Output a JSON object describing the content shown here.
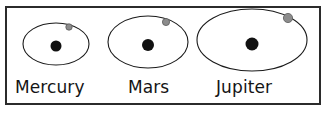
{
  "figure": {
    "background_color": "#ffffff",
    "frame": {
      "border_color": "#2b2b2b",
      "border_width": 2,
      "fill_color": "#ffffff"
    },
    "colors": {
      "orbit_stroke": "#1a1a1a",
      "central_body": "#111111",
      "orbiting_body_fill": "#8c8c8c",
      "orbiting_body_stroke": "#5a5a5a",
      "label_text": "#151515"
    },
    "systems": [
      {
        "name": "Mercury",
        "label": "Mercury",
        "orbit": {
          "cx": 56,
          "cy": 44,
          "rx": 33,
          "ry": 21
        },
        "central_body": {
          "cx": 56,
          "cy": 46,
          "r": 5.5
        },
        "orbiting_body": {
          "cx": 69,
          "cy": 27,
          "r": 3.2
        }
      },
      {
        "name": "Mars",
        "label": "Mars",
        "orbit": {
          "cx": 148,
          "cy": 42,
          "rx": 40,
          "ry": 26
        },
        "central_body": {
          "cx": 148,
          "cy": 45,
          "r": 6
        },
        "orbiting_body": {
          "cx": 166,
          "cy": 22,
          "r": 3.6
        }
      },
      {
        "name": "Jupiter",
        "label": "Jupiter",
        "orbit": {
          "cx": 252,
          "cy": 40,
          "rx": 55,
          "ry": 31
        },
        "central_body": {
          "cx": 252,
          "cy": 44,
          "r": 6.5
        },
        "orbiting_body": {
          "cx": 288,
          "cy": 18,
          "r": 4.6
        }
      }
    ]
  }
}
